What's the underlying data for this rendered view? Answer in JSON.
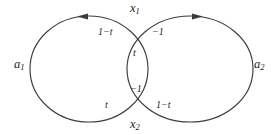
{
  "figure": {
    "type": "knot-diagram",
    "background_color": "#ffffff",
    "curve_color": "#3a3a42",
    "text_color": "#1d1d22"
  },
  "loops": [
    {
      "name": "left-loop",
      "label": "a",
      "subscript": "1",
      "orientation": "counterclockwise",
      "arrow_direction": "left",
      "center_x": 89,
      "center_y": 69,
      "radius_x": 59,
      "radius_y": 53
    },
    {
      "name": "right-loop",
      "label": "a",
      "subscript": "2",
      "orientation": "clockwise",
      "arrow_direction": "right",
      "center_x": 190,
      "center_y": 69,
      "radius_x": 63,
      "radius_y": 53
    }
  ],
  "crossings": [
    {
      "name": "upper-crossing",
      "x": 139,
      "y": 38
    },
    {
      "name": "lower-crossing",
      "x": 139,
      "y": 100
    }
  ],
  "labels": {
    "strand_top": {
      "base": "x",
      "sub": "1"
    },
    "strand_bottom": {
      "base": "x",
      "sub": "2"
    },
    "loop_left": {
      "base": "a",
      "sub": "1"
    },
    "loop_right": {
      "base": "a",
      "sub": "2"
    },
    "top_left_weight": "1−t",
    "top_right_weight": "−1",
    "lens_upper_weight": "t",
    "lens_lower_weight": "−1",
    "bottom_left_weight": "t",
    "bottom_right_weight": "1−t"
  }
}
